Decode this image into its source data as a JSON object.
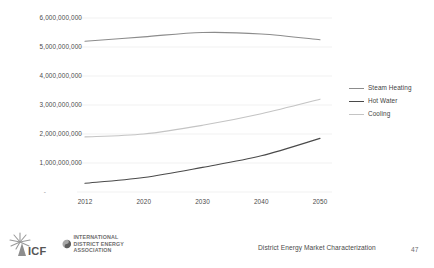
{
  "chart_data": {
    "type": "line",
    "title": "",
    "subtitle": "",
    "xlabel": "",
    "ylabel": "",
    "x": [
      2012,
      2020,
      2030,
      2040,
      2050
    ],
    "categories": [
      "2012",
      "2020",
      "2030",
      "2040",
      "2050"
    ],
    "xtick_labels": [
      "2012",
      "2020",
      "2030",
      "2040",
      "2050"
    ],
    "ytick_labels": [
      "6,000,000,000",
      "5,000,000,000",
      "4,000,000,000",
      "3,000,000,000",
      "2,000,000,000",
      "1,000,000,000",
      "-"
    ],
    "ytick_values": [
      6000000000,
      5000000000,
      4000000000,
      3000000000,
      2000000000,
      1000000000,
      0
    ],
    "ylim": [
      0,
      6000000000
    ],
    "xlim": [
      2012,
      2050
    ],
    "grid": true,
    "grid_axis": "y",
    "legend_position": "right",
    "series": [
      {
        "name": "Steam Heating",
        "color": "#8c8c8c",
        "values": [
          5200000000,
          5350000000,
          5500000000,
          5450000000,
          5250000000
        ]
      },
      {
        "name": "Hot Water",
        "color": "#4a4a4a",
        "values": [
          300000000,
          500000000,
          850000000,
          1250000000,
          1850000000
        ]
      },
      {
        "name": "Cooling",
        "color": "#c4c4c4",
        "values": [
          1900000000,
          2000000000,
          2300000000,
          2700000000,
          3200000000
        ]
      }
    ]
  },
  "legend": {
    "items": [
      {
        "label": "Steam Heating",
        "color": "#8c8c8c"
      },
      {
        "label": "Hot Water",
        "color": "#4a4a4a"
      },
      {
        "label": "Cooling",
        "color": "#c4c4c4"
      }
    ]
  },
  "footer": {
    "title": "District Energy Market Characterization",
    "page_number": "47",
    "logos": [
      {
        "name": "icf-logo",
        "text": "ICF"
      },
      {
        "name": "idea-logo",
        "lines": [
          "INTERNATIONAL",
          "DISTRICT ENERGY",
          "ASSOCIATION"
        ]
      }
    ]
  },
  "colors": {
    "background": "#ffffff",
    "gridline": "#ededed",
    "text": "#4a4a4a",
    "steam_heating": "#8c8c8c",
    "hot_water": "#4a4a4a",
    "cooling": "#c4c4c4"
  }
}
